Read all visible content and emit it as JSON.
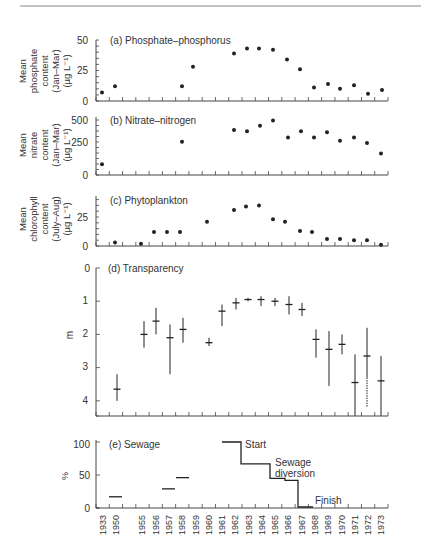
{
  "figure": {
    "top_rule": true,
    "x_axis": {
      "slots": [
        "1933",
        "1950",
        "",
        "1955",
        "1956",
        "1957",
        "1958",
        "1959",
        "1960",
        "1961",
        "1962",
        "1963",
        "1964",
        "1965",
        "1966",
        "1967",
        "1968",
        "1969",
        "1970",
        "1971",
        "1972",
        "1973"
      ]
    }
  },
  "chart_data": [
    {
      "type": "scatter",
      "title": "(a) Phosphate–phosphorus",
      "ylabel": [
        "Mean",
        "phosphate",
        "content",
        "(Jan–Mar)",
        "(µg L⁻¹)"
      ],
      "yticks": [
        0,
        25,
        50
      ],
      "ylim": [
        0,
        50
      ],
      "x": [
        "1933",
        "1950",
        "1957",
        "1958",
        "1961",
        "1962",
        "1963",
        "1964",
        "1965",
        "1966",
        "1967",
        "1968",
        "1969",
        "1970",
        "1971",
        "1972",
        "1973"
      ],
      "values": [
        7,
        12,
        12,
        28,
        39,
        43,
        43,
        42,
        34,
        26,
        11,
        14,
        10,
        13,
        6,
        9
      ]
    },
    {
      "type": "scatter",
      "title": "(b) Nitrate–nitrogen",
      "ylabel": [
        "Mean",
        "nitrate",
        "content",
        "(Jan–Mar)",
        "(µg L⁻¹)"
      ],
      "yticks": [
        0,
        250,
        500
      ],
      "ylim": [
        0,
        600
      ],
      "x": [
        "1933",
        "1958",
        "1961",
        "1962",
        "1963",
        "1964",
        "1965",
        "1966",
        "1967",
        "1968",
        "1969",
        "1970",
        "1971",
        "1972",
        "1973"
      ],
      "values": [
        100,
        310,
        420,
        410,
        460,
        510,
        350,
        410,
        350,
        400,
        320,
        350,
        300,
        200
      ]
    },
    {
      "type": "scatter",
      "title": "(c) Phytoplankton",
      "ylabel": [
        "Mean",
        "chlorophyll",
        "content",
        "(July–Aug)",
        "(µg L⁻¹)"
      ],
      "yticks": [
        0,
        25
      ],
      "ylim": [
        0,
        40
      ],
      "x": [
        "1950",
        "1956",
        "1957",
        "1958",
        "1959",
        "1961",
        "1963",
        "1964",
        "1965",
        "1966",
        "1967",
        "1968",
        "1969",
        "1970",
        "1971",
        "1972",
        "1973"
      ],
      "values": [
        3,
        2,
        12,
        12,
        12,
        21,
        31,
        34,
        35,
        23,
        21,
        13,
        12,
        6,
        6,
        5,
        5,
        1
      ]
    },
    {
      "type": "errorbar",
      "title": "(d) Transparency",
      "ylabel": [
        "m"
      ],
      "yticks": [
        0,
        1,
        2,
        3,
        4
      ],
      "ylim": [
        0,
        4.5
      ],
      "y_inverted": true,
      "points": [
        {
          "x": "1950",
          "mean": 3.65,
          "lo": 3.2,
          "hi": 4.0
        },
        {
          "x": "1956",
          "mean": 2.0,
          "lo": 1.6,
          "hi": 2.4
        },
        {
          "x": "1957",
          "mean": 1.6,
          "lo": 1.2,
          "hi": 2.0
        },
        {
          "x": "1958",
          "mean": 2.1,
          "lo": 1.7,
          "hi": 3.2
        },
        {
          "x": "1959",
          "mean": 1.85,
          "lo": 1.5,
          "hi": 2.25
        },
        {
          "x": "1961",
          "mean": 2.25,
          "lo": 2.1,
          "hi": 2.35
        },
        {
          "x": "1962",
          "mean": 1.3,
          "lo": 1.1,
          "hi": 1.75
        },
        {
          "x": "1963",
          "mean": 1.05,
          "lo": 0.9,
          "hi": 1.25
        },
        {
          "x": "1964",
          "mean": 0.95,
          "lo": 0.9,
          "hi": 1.0
        },
        {
          "x": "1965",
          "mean": 0.95,
          "lo": 0.85,
          "hi": 1.15
        },
        {
          "x": "1966",
          "mean": 1.0,
          "lo": 0.9,
          "hi": 1.15
        },
        {
          "x": "1967",
          "mean": 1.1,
          "lo": 0.85,
          "hi": 1.4
        },
        {
          "x": "1968",
          "mean": 1.25,
          "lo": 1.05,
          "hi": 1.45
        },
        {
          "x": "1969",
          "mean": 2.15,
          "lo": 1.85,
          "hi": 2.7
        },
        {
          "x": "1970",
          "mean": 2.45,
          "lo": 1.9,
          "hi": 3.55
        },
        {
          "x": "1971",
          "mean": 2.3,
          "lo": 2.0,
          "hi": 2.6
        },
        {
          "x": "1972",
          "mean": 3.45,
          "lo": 2.6,
          "hi": 4.45
        },
        {
          "x": "1973",
          "mean": 2.65,
          "lo": 1.8,
          "hi": 4.2,
          "dashed_below": 3.3
        },
        {
          "x": "1973b",
          "mean": 3.4,
          "lo": 2.65,
          "hi": 4.45
        }
      ]
    },
    {
      "type": "step",
      "title": "(e) Sewage",
      "ylabel": [
        "%"
      ],
      "yticks": [
        0,
        50,
        100
      ],
      "ylim": [
        0,
        100
      ],
      "segments": [
        {
          "from": "1950",
          "to": "1950",
          "value": 17
        },
        {
          "from": "1957",
          "to": "1957",
          "value": 29
        },
        {
          "from": "1958",
          "to": "1958",
          "value": 46
        }
      ],
      "step_series": [
        {
          "x": "1961",
          "value": 100
        },
        {
          "x": "1963",
          "value": 67
        },
        {
          "x": "1965",
          "value": 45
        },
        {
          "x": "1966",
          "value": 42
        },
        {
          "x": "1967",
          "value": 2
        },
        {
          "x": "1968",
          "value": 0
        }
      ],
      "annotations": [
        "Start",
        "Sewage",
        "diversion",
        "Finish"
      ]
    }
  ],
  "panels": {
    "a": {
      "title": "(a) Phosphate–phosphorus",
      "ylabel": [
        "Mean",
        "phosphate",
        "content",
        "(Jan–Mar)",
        "(µg L⁻¹)"
      ],
      "ticks": [
        "0",
        "25",
        "50"
      ]
    },
    "b": {
      "title": "(b) Nitrate–nitrogen",
      "ylabel": [
        "Mean",
        "nitrate",
        "content",
        "(Jan–Mar)",
        "(µg L⁻¹)"
      ],
      "ticks": [
        "0",
        "250",
        "500"
      ]
    },
    "c": {
      "title": "(c) Phytoplankton",
      "ylabel": [
        "Mean",
        "chlorophyll",
        "content",
        "(July–Aug)",
        "(µg L⁻¹)"
      ],
      "ticks": [
        "0",
        "25"
      ]
    },
    "d": {
      "title": "(d) Transparency",
      "ylabel": "m",
      "ticks": [
        "0",
        "1",
        "2",
        "3",
        "4"
      ]
    },
    "e": {
      "title": "(e) Sewage",
      "ylabel": "%",
      "ticks": [
        "0",
        "50",
        "100"
      ],
      "start_label": "Start",
      "diversion_label_1": "Sewage",
      "diversion_label_2": "diversion",
      "finish_label": "Finish"
    }
  }
}
